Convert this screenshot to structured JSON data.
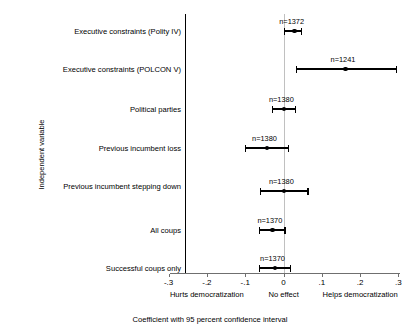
{
  "chart_data": {
    "type": "scatter",
    "title": "",
    "xlabel": "Coefficient with 95 percent confidence interval",
    "ylabel": "Independent variable",
    "xlim": [
      -0.3,
      0.3
    ],
    "xticks": [
      "-.3",
      "-.2",
      "-.1",
      "0",
      ".1",
      ".2",
      ".3"
    ],
    "xtick_values": [
      -0.3,
      -0.2,
      -0.1,
      0,
      0.1,
      0.2,
      0.3
    ],
    "grid": false,
    "legend": "none",
    "zero_reference_line": 0,
    "categories": [
      "Executive constraints (Polity IV)",
      "Executive constraints (POLCON V)",
      "Political parties",
      "Previous incumbent loss",
      "Previous incumbent stepping down",
      "All coups",
      "Successful coups only"
    ],
    "points": [
      {
        "label": "Executive constraints (Polity IV)",
        "estimate": 0.028,
        "ci_low": 0.002,
        "ci_high": 0.046,
        "n_label": "n=1372"
      },
      {
        "label": "Executive constraints (POLCON V)",
        "estimate": 0.162,
        "ci_low": 0.034,
        "ci_high": 0.296,
        "n_label": "n=1241"
      },
      {
        "label": "Political parties",
        "estimate": 0.001,
        "ci_low": -0.028,
        "ci_high": 0.031,
        "n_label": "n=1380"
      },
      {
        "label": "Previous incumbent loss",
        "estimate": -0.043,
        "ci_low": -0.1,
        "ci_high": 0.014,
        "n_label": "n=1380"
      },
      {
        "label": "Previous incumbent stepping down",
        "estimate": 0.001,
        "ci_low": -0.059,
        "ci_high": 0.064,
        "n_label": "n=1380"
      },
      {
        "label": "All coups",
        "estimate": -0.029,
        "ci_low": -0.062,
        "ci_high": 0.004,
        "n_label": "n=1370"
      },
      {
        "label": "Successful coups only",
        "estimate": -0.022,
        "ci_low": -0.062,
        "ci_high": 0.018,
        "n_label": "n=1370"
      }
    ],
    "x_axis_annotations": [
      {
        "text": "Hurts democratization",
        "at": -0.2
      },
      {
        "text": "No effect",
        "at": 0.0
      },
      {
        "text": "Helps democratization",
        "at": 0.2
      }
    ]
  },
  "axis": {
    "y_title": "Independent variable",
    "x_title": "Coefficient with 95 percent confidence interval"
  }
}
